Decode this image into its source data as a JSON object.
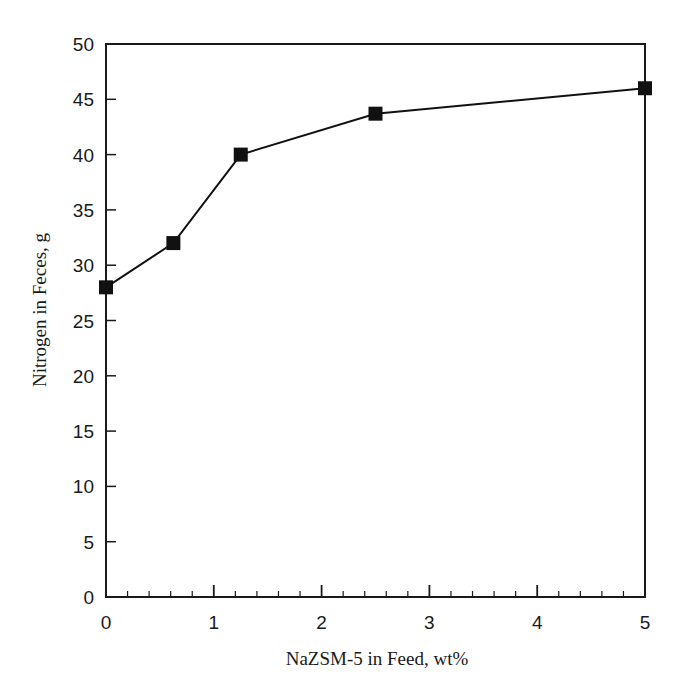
{
  "chart_data": {
    "type": "line",
    "title": "",
    "xlabel": "NaZSM-5 in Feed, wt%",
    "ylabel": "Nitrogen in Feces, g",
    "xlim": [
      0,
      5
    ],
    "ylim": [
      0,
      50
    ],
    "x_ticks": [
      0,
      1,
      2,
      3,
      4,
      5
    ],
    "x_tick_labels": [
      "0",
      "1",
      "2",
      "3",
      "4",
      "5"
    ],
    "x_minor_step": 0.2,
    "y_ticks": [
      0,
      5,
      10,
      15,
      20,
      25,
      30,
      35,
      40,
      45,
      50
    ],
    "y_tick_labels": [
      "0",
      "5",
      "10",
      "15",
      "20",
      "25",
      "30",
      "35",
      "40",
      "45",
      "50"
    ],
    "grid": false,
    "legend": null,
    "series": [
      {
        "name": "Nitrogen in Feces",
        "marker": "filled-square",
        "color": "#111111",
        "x": [
          0,
          0.625,
          1.25,
          2.5,
          5
        ],
        "y": [
          28,
          32,
          40,
          43.7,
          46
        ]
      }
    ]
  }
}
